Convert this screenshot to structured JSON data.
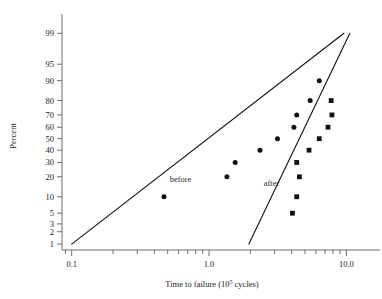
{
  "chart_data": {
    "type": "scatter",
    "title": "",
    "xlabel": "Time to failure (10^5 cycles)",
    "xlabel_base": "Time to failure (10",
    "xlabel_exp": "5",
    "xlabel_tail": " cycles)",
    "ylabel": "Percent",
    "xscale": "log",
    "yscale": "probability",
    "xlim": [
      0.085,
      13.0
    ],
    "ylim": [
      0.7,
      99.5
    ],
    "xticklabels": [
      "0.1",
      "1.0",
      "10.0"
    ],
    "xtickvalues": [
      0.1,
      1.0,
      10.0
    ],
    "yticklabels": [
      "99",
      "95",
      "90",
      "80",
      "70",
      "60",
      "50",
      "40",
      "30",
      "20",
      "10",
      "5",
      "3",
      "2",
      "1"
    ],
    "ytickvalues": [
      99,
      95,
      90,
      80,
      70,
      60,
      50,
      40,
      30,
      20,
      10,
      5,
      3,
      2,
      1
    ],
    "grid": false,
    "legend_position": "inline-annotations",
    "annotations": [
      {
        "text": "before",
        "x": 0.62,
        "y": 17.0
      },
      {
        "text": "after",
        "x": 2.85,
        "y": 15.0
      }
    ],
    "series": [
      {
        "name": "before",
        "marker": "circle",
        "color": "#111111",
        "points": [
          {
            "x": 0.47,
            "y": 10
          },
          {
            "x": 1.35,
            "y": 20
          },
          {
            "x": 1.55,
            "y": 30
          },
          {
            "x": 2.35,
            "y": 40
          },
          {
            "x": 3.15,
            "y": 50
          },
          {
            "x": 4.15,
            "y": 60
          },
          {
            "x": 4.35,
            "y": 70
          },
          {
            "x": 5.45,
            "y": 80
          },
          {
            "x": 6.35,
            "y": 90
          }
        ],
        "fit_line": {
          "x1": 0.1,
          "y1": 1.0,
          "x2": 9.6,
          "y2": 99.0
        }
      },
      {
        "name": "after",
        "marker": "square",
        "color": "#111111",
        "points": [
          {
            "x": 4.05,
            "y": 5
          },
          {
            "x": 4.35,
            "y": 10
          },
          {
            "x": 4.55,
            "y": 20
          },
          {
            "x": 4.35,
            "y": 30
          },
          {
            "x": 5.35,
            "y": 40
          },
          {
            "x": 6.35,
            "y": 50
          },
          {
            "x": 7.35,
            "y": 60
          },
          {
            "x": 7.85,
            "y": 70
          },
          {
            "x": 7.75,
            "y": 80
          }
        ],
        "fit_line": {
          "x1": 1.95,
          "y1": 1.0,
          "x2": 10.6,
          "y2": 99.0
        }
      }
    ]
  }
}
